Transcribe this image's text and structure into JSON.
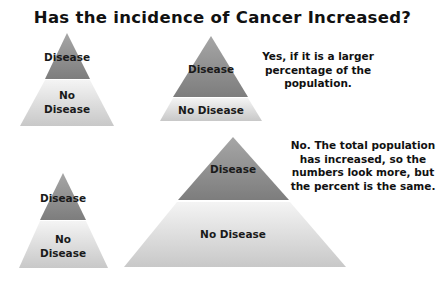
{
  "title": "Has the incidence of Cancer Increased?",
  "colors": {
    "disease_dark": "#7d7d7d",
    "disease_light": "#a6a6a6",
    "no_disease_top": "#f2f2f2",
    "no_disease_bottom": "#c9c9c9"
  },
  "pyramids": [
    {
      "id": "small-top-left",
      "disease_label": "Disease",
      "no_disease_label_line1": "No",
      "no_disease_label_line2": "Disease"
    },
    {
      "id": "larger-disease-top-middle",
      "disease_label": "Disease",
      "no_disease_label": "No Disease"
    },
    {
      "id": "small-bottom-left",
      "disease_label": "Disease",
      "no_disease_label_line1": "No",
      "no_disease_label_line2": "Disease"
    },
    {
      "id": "large-bottom",
      "disease_label": "Disease",
      "no_disease_label": "No Disease"
    }
  ],
  "notes": {
    "yes": [
      "Yes, if it is a larger",
      "percentage of the",
      "population."
    ],
    "no": [
      "No. The total population",
      "has increased, so the",
      "numbers look more, but",
      "the percent is the same."
    ]
  }
}
